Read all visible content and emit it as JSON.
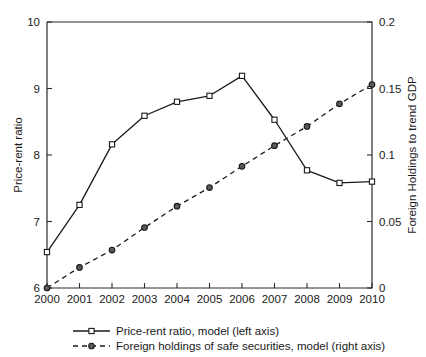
{
  "chart_data": {
    "type": "line",
    "title": "",
    "xlabel": "",
    "categories": [
      "2000",
      "2001",
      "2002",
      "2003",
      "2004",
      "2005",
      "2006",
      "2007",
      "2008",
      "2009",
      "2010"
    ],
    "x": [
      2000,
      2001,
      2002,
      2003,
      2004,
      2005,
      2006,
      2007,
      2008,
      2009,
      2010
    ],
    "grid": false,
    "legend_position": "bottom",
    "axes": {
      "left": {
        "label": "Price-rent ratio",
        "ylim": [
          6,
          10
        ],
        "ticks": [
          6,
          7,
          8,
          9,
          10
        ],
        "tick_labels": [
          "6",
          "7",
          "8",
          "9",
          "10"
        ]
      },
      "right": {
        "label": "Foreign Holdings to trend GDP",
        "ylim": [
          0,
          0.2
        ],
        "ticks": [
          0,
          0.05,
          0.1,
          0.15,
          0.2
        ],
        "tick_labels": [
          "0",
          "0.05",
          "0.1",
          "0.15",
          "0.2"
        ]
      }
    },
    "series": [
      {
        "name": "Price-rent ratio, model (left axis)",
        "axis": "left",
        "style": "solid",
        "marker": "square",
        "values": [
          6.54,
          7.25,
          8.16,
          8.59,
          8.8,
          8.89,
          9.19,
          8.53,
          7.77,
          7.58,
          7.6
        ]
      },
      {
        "name": "Foreign holdings of safe securities, model (right axis)",
        "axis": "right",
        "style": "dashed",
        "marker": "circle",
        "values": [
          0.0,
          0.0155,
          0.0285,
          0.0455,
          0.0615,
          0.0755,
          0.0915,
          0.107,
          0.1215,
          0.1385,
          0.153
        ]
      }
    ]
  },
  "legend": {
    "items": [
      {
        "label": "Price-rent ratio, model (left axis)",
        "style": "solid",
        "marker": "square"
      },
      {
        "label": "Foreign holdings of safe securities, model (right axis)",
        "style": "dashed",
        "marker": "circle"
      }
    ]
  }
}
